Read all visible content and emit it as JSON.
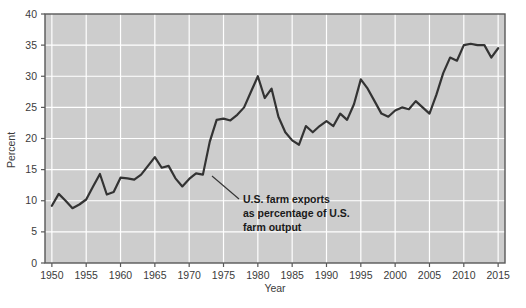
{
  "chart_data": {
    "type": "line",
    "title": "",
    "xlabel": "Year",
    "ylabel": "Percent",
    "xlim": [
      1949,
      2016
    ],
    "ylim": [
      0,
      40
    ],
    "grid": true,
    "legend": "none",
    "series_name": "U.S. farm exports as percentage of U.S. farm output",
    "x_ticks": [
      "1950",
      "1955",
      "1960",
      "1965",
      "1970",
      "1975",
      "1980",
      "1985",
      "1990",
      "1995",
      "2000",
      "2005",
      "2010",
      "2015"
    ],
    "y_ticks": [
      "0",
      "5",
      "10",
      "15",
      "20",
      "25",
      "30",
      "35",
      "40"
    ],
    "annotation": {
      "line1": "U.S. farm exports",
      "line2": "as percentage of U.S.",
      "line3": "farm output"
    },
    "colors": {
      "plot_background": "#cdcdcd",
      "gridline": "#ffffff",
      "line": "#333333",
      "axis": "#595959",
      "text": "#3b3b3b",
      "annotation_text": "#1a1a1a"
    },
    "x": [
      1950,
      1951,
      1952,
      1953,
      1954,
      1955,
      1956,
      1957,
      1958,
      1959,
      1960,
      1961,
      1962,
      1963,
      1964,
      1965,
      1966,
      1967,
      1968,
      1969,
      1970,
      1971,
      1972,
      1973,
      1974,
      1975,
      1976,
      1977,
      1978,
      1979,
      1980,
      1981,
      1982,
      1983,
      1984,
      1985,
      1986,
      1987,
      1988,
      1989,
      1990,
      1991,
      1992,
      1993,
      1994,
      1995,
      1996,
      1997,
      1998,
      1999,
      2000,
      2001,
      2002,
      2003,
      2004,
      2005,
      2006,
      2007,
      2008,
      2009,
      2010,
      2011,
      2012,
      2013,
      2014,
      2015
    ],
    "values": [
      9.2,
      11.1,
      10.0,
      8.8,
      9.4,
      10.2,
      12.3,
      14.3,
      11.0,
      11.4,
      13.7,
      13.6,
      13.4,
      14.2,
      15.6,
      17.0,
      15.3,
      15.6,
      13.6,
      12.3,
      13.5,
      14.4,
      14.2,
      19.5,
      23.0,
      23.2,
      22.9,
      23.8,
      25.0,
      27.5,
      30.0,
      26.5,
      28.0,
      23.5,
      21.0,
      19.7,
      19.0,
      22.0,
      21.0,
      22.0,
      22.8,
      22.0,
      24.0,
      23.0,
      25.5,
      29.5,
      28.0,
      26.0,
      24.0,
      23.5,
      24.5,
      25.0,
      24.7,
      26.0,
      25.0,
      24.0,
      27.0,
      30.5,
      33.0,
      32.5,
      35.0,
      35.2,
      35.0,
      35.0,
      33.0,
      34.5
    ]
  }
}
